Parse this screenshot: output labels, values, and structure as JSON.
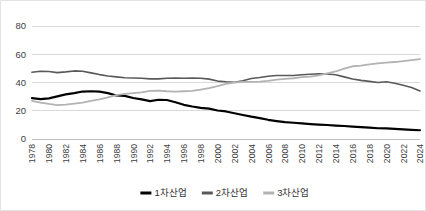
{
  "chart_data": {
    "type": "line",
    "title": "",
    "xlabel": "",
    "ylabel": "",
    "ylim": [
      0,
      80
    ],
    "ytick_values": [
      0,
      20,
      40,
      60,
      80
    ],
    "ytick_labels": [
      "0",
      "20",
      "40",
      "60",
      "80"
    ],
    "grid": true,
    "legend_position": "bottom",
    "x": [
      1978,
      1979,
      1980,
      1981,
      1982,
      1983,
      1984,
      1985,
      1986,
      1987,
      1988,
      1989,
      1990,
      1991,
      1992,
      1993,
      1994,
      1995,
      1996,
      1997,
      1998,
      1999,
      2000,
      2001,
      2002,
      2003,
      2004,
      2005,
      2006,
      2007,
      2008,
      2009,
      2010,
      2011,
      2012,
      2013,
      2014,
      2015,
      2016,
      2017,
      2018,
      2019,
      2020,
      2021,
      2022,
      2023,
      2024
    ],
    "xtick_labels": [
      "1978",
      "1980",
      "1982",
      "1984",
      "1986",
      "1988",
      "1990",
      "1992",
      "1994",
      "1996",
      "1998",
      "2000",
      "2002",
      "2004",
      "2006",
      "2008",
      "2010",
      "2012",
      "2014",
      "2016",
      "2018",
      "2020",
      "2022",
      "2024"
    ],
    "series": [
      {
        "name": "1차산업",
        "color": "#000000",
        "width": 2.2,
        "values": [
          29.0,
          28.2,
          28.8,
          30.2,
          31.6,
          32.5,
          33.6,
          33.8,
          33.5,
          32.5,
          30.8,
          30.5,
          29.0,
          28.0,
          26.8,
          27.8,
          27.6,
          26.0,
          24.2,
          23.0,
          22.0,
          21.5,
          20.2,
          19.5,
          18.2,
          17.0,
          15.8,
          14.8,
          13.6,
          12.7,
          11.9,
          11.5,
          11.0,
          10.6,
          10.2,
          9.9,
          9.5,
          9.2,
          8.8,
          8.4,
          8.0,
          7.6,
          7.5,
          7.2,
          6.8,
          6.5,
          6.2
        ]
      },
      {
        "name": "2차산업",
        "color": "#595959",
        "width": 1.6,
        "values": [
          47.2,
          48.0,
          47.8,
          47.0,
          47.5,
          48.2,
          48.0,
          46.8,
          45.6,
          44.6,
          44.0,
          43.4,
          43.2,
          43.0,
          42.6,
          42.6,
          43.0,
          43.2,
          43.0,
          43.2,
          43.0,
          42.4,
          41.0,
          40.5,
          40.2,
          41.2,
          42.8,
          43.5,
          44.4,
          45.0,
          45.0,
          45.0,
          45.5,
          45.8,
          46.2,
          46.0,
          45.5,
          44.0,
          42.5,
          41.5,
          40.8,
          40.0,
          40.5,
          39.5,
          38.0,
          36.5,
          34.0
        ]
      },
      {
        "name": "3차산업",
        "color": "#b3b3b3",
        "width": 1.8,
        "values": [
          27.0,
          25.8,
          24.8,
          24.0,
          24.3,
          25.0,
          25.8,
          27.0,
          28.0,
          29.5,
          31.0,
          32.0,
          32.5,
          33.0,
          34.0,
          34.2,
          33.8,
          33.6,
          33.8,
          34.0,
          35.0,
          36.0,
          37.5,
          39.0,
          40.0,
          40.4,
          40.4,
          40.6,
          41.2,
          42.0,
          42.6,
          43.0,
          43.8,
          44.2,
          45.0,
          46.5,
          47.8,
          49.8,
          51.5,
          52.0,
          52.8,
          53.5,
          54.0,
          54.5,
          55.2,
          55.8,
          56.5
        ]
      }
    ]
  },
  "legend": {
    "items": [
      {
        "label": "1차산업",
        "color": "#000000"
      },
      {
        "label": "2차산업",
        "color": "#595959"
      },
      {
        "label": "3차산업",
        "color": "#b3b3b3"
      }
    ]
  }
}
